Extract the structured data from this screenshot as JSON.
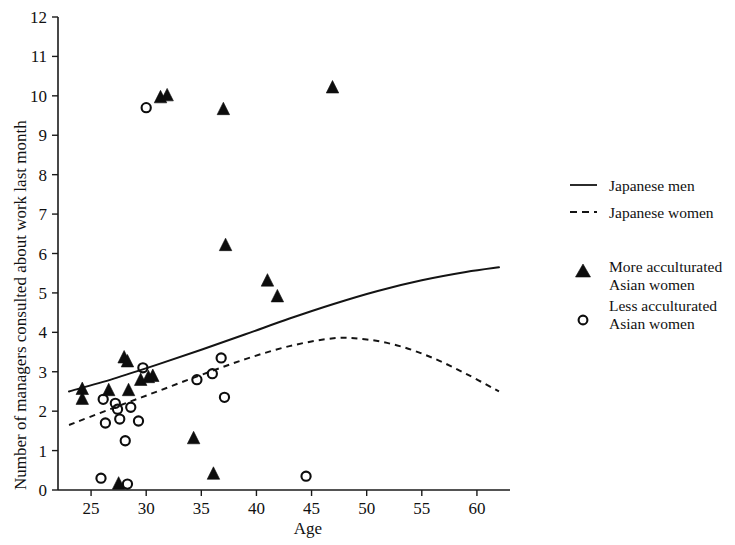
{
  "chart_data": {
    "type": "scatter",
    "title": "",
    "xlabel": "Age",
    "ylabel": "Number of managers consulted about work last month",
    "xlim": [
      22,
      63
    ],
    "ylim": [
      0,
      12
    ],
    "xticks": [
      25,
      30,
      35,
      40,
      45,
      50,
      55,
      60
    ],
    "yticks": [
      0,
      1,
      2,
      3,
      4,
      5,
      6,
      7,
      8,
      9,
      10,
      11,
      12
    ],
    "grid": false,
    "legend_position": "right",
    "legend": [
      {
        "name": "Japanese men",
        "marker": "solid-line"
      },
      {
        "name": "Japanese women",
        "marker": "dashed-line"
      },
      {
        "name": "More acculturated Asian women",
        "marker": "filled-triangle"
      },
      {
        "name": "Less acculturated Asian women",
        "marker": "open-circle"
      }
    ],
    "series": [
      {
        "name": "More acculturated Asian women",
        "marker": "filled-triangle",
        "points": [
          [
            24.2,
            2.55
          ],
          [
            24.2,
            2.3
          ],
          [
            26.6,
            2.52
          ],
          [
            27.5,
            0.15
          ],
          [
            28.0,
            3.35
          ],
          [
            28.3,
            3.25
          ],
          [
            28.4,
            2.52
          ],
          [
            29.5,
            2.78
          ],
          [
            30.2,
            2.85
          ],
          [
            30.6,
            2.88
          ],
          [
            31.3,
            9.95
          ],
          [
            31.9,
            10.0
          ],
          [
            34.3,
            1.3
          ],
          [
            36.1,
            0.4
          ],
          [
            37.0,
            9.65
          ],
          [
            37.2,
            6.2
          ],
          [
            41.0,
            5.3
          ],
          [
            41.9,
            4.9
          ],
          [
            46.9,
            10.2
          ]
        ]
      },
      {
        "name": "Less acculturated Asian women",
        "marker": "open-circle",
        "points": [
          [
            25.9,
            0.3
          ],
          [
            26.1,
            2.3
          ],
          [
            26.3,
            1.7
          ],
          [
            27.2,
            2.2
          ],
          [
            27.4,
            2.05
          ],
          [
            27.6,
            1.8
          ],
          [
            28.1,
            1.25
          ],
          [
            28.3,
            0.15
          ],
          [
            28.6,
            2.1
          ],
          [
            29.3,
            1.75
          ],
          [
            29.7,
            3.1
          ],
          [
            30.0,
            9.7
          ],
          [
            34.6,
            2.8
          ],
          [
            36.0,
            2.95
          ],
          [
            36.8,
            3.35
          ],
          [
            37.1,
            2.35
          ],
          [
            44.5,
            0.35
          ]
        ]
      }
    ],
    "curves": [
      {
        "name": "Japanese men",
        "style": "solid",
        "points": [
          [
            23.0,
            2.5
          ],
          [
            27.0,
            2.82
          ],
          [
            31.0,
            3.18
          ],
          [
            35.0,
            3.56
          ],
          [
            39.0,
            3.95
          ],
          [
            43.0,
            4.35
          ],
          [
            47.0,
            4.72
          ],
          [
            51.0,
            5.05
          ],
          [
            55.0,
            5.32
          ],
          [
            59.0,
            5.53
          ],
          [
            62.0,
            5.65
          ]
        ]
      },
      {
        "name": "Japanese women",
        "style": "dashed",
        "points": [
          [
            23.0,
            1.65
          ],
          [
            27.0,
            2.08
          ],
          [
            31.0,
            2.5
          ],
          [
            35.0,
            2.92
          ],
          [
            39.0,
            3.32
          ],
          [
            43.0,
            3.65
          ],
          [
            47.0,
            3.85
          ],
          [
            50.0,
            3.82
          ],
          [
            53.0,
            3.65
          ],
          [
            56.0,
            3.35
          ],
          [
            59.0,
            2.95
          ],
          [
            62.0,
            2.5
          ]
        ]
      }
    ]
  },
  "axes": {
    "x_title": "Age",
    "y_title": "Number of managers consulted about work last month",
    "x_tick_labels": [
      "25",
      "30",
      "35",
      "40",
      "45",
      "50",
      "55",
      "60"
    ],
    "y_tick_labels": [
      "0",
      "1",
      "2",
      "3",
      "4",
      "5",
      "6",
      "7",
      "8",
      "9",
      "10",
      "11",
      "12"
    ]
  },
  "legend": {
    "items": [
      {
        "label": "Japanese men",
        "icon": "solid-line-icon"
      },
      {
        "label": "Japanese women",
        "icon": "dashed-line-icon"
      },
      {
        "label_line1": "More acculturated",
        "label_line2": "Asian women",
        "icon": "filled-triangle-icon"
      },
      {
        "label_line1": "Less acculturated",
        "label_line2": "Asian women",
        "icon": "open-circle-icon"
      }
    ]
  },
  "colors": {
    "ink": "#111111",
    "background": "#ffffff"
  }
}
